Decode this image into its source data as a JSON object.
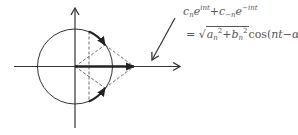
{
  "diagram": {
    "type": "phasor-diagram",
    "colors": {
      "stroke": "#333333",
      "text": "#555555",
      "background": "#ffffff"
    },
    "axes": {
      "horizontal_arrow": true,
      "vertical_arrow": true
    },
    "formula": {
      "line1": {
        "c_n": "c",
        "n_sub": "n",
        "e1": "e",
        "exp1": "int",
        "plus": "+",
        "c_minus_n": "c",
        "minus_n_sub": "−n",
        "e2": "e",
        "exp2": "−int"
      },
      "line2": {
        "equals": "=",
        "sqrt_open": "√",
        "a": "a",
        "a_sub": "n",
        "a_sup": "2",
        "plus": "+",
        "b": "b",
        "b_sub": "n",
        "b_sup": "2",
        "cos": "cos(",
        "nt": "nt",
        "minus": "−",
        "alpha": "α",
        "alpha_sub": "n",
        "close": ")"
      }
    }
  }
}
